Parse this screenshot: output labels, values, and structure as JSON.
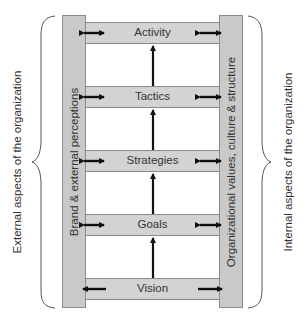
{
  "diagram": {
    "rows": [
      {
        "label": "Activity",
        "left_arrow": "double",
        "right_arrow": "double"
      },
      {
        "label": "Tactics",
        "left_arrow": "double",
        "right_arrow": "double"
      },
      {
        "label": "Strategies",
        "left_arrow": "double",
        "right_arrow": "double"
      },
      {
        "label": "Goals",
        "left_arrow": "double",
        "right_arrow": "double"
      },
      {
        "label": "Vision",
        "left_arrow": "left",
        "right_arrow": "right"
      }
    ],
    "left_pillar_label": "Brand & external perceptions",
    "right_pillar_label": "Organizational values, culture & structure",
    "left_brace_label": "External aspects of the organization",
    "right_brace_label": "Internal aspects of the organization",
    "colors": {
      "pillar_fill": "#c9c9c9",
      "row_fill": "#d3d3d3",
      "arrow": "#111111",
      "outline": "#8a8a8a"
    }
  }
}
